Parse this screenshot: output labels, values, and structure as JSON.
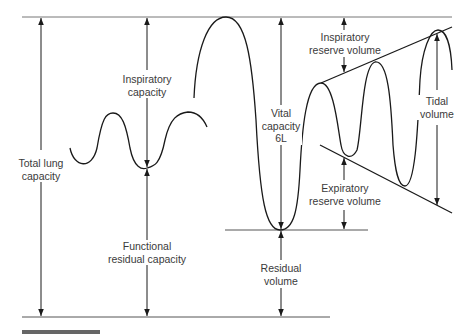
{
  "diagram": {
    "title": "",
    "labels": {
      "total_lung_capacity": [
        "Total lung",
        "capacity"
      ],
      "inspiratory_capacity": [
        "Inspiratory",
        "capacity"
      ],
      "functional_residual_capacity": [
        "Functional",
        "residual capacity"
      ],
      "vital_capacity": [
        "Vital",
        "capacity",
        "6L"
      ],
      "residual_volume": [
        "Residual",
        "volume"
      ],
      "inspiratory_reserve_volume": [
        "Inspiratory",
        "reserve volume"
      ],
      "expiratory_reserve_volume": [
        "Expiratory",
        "reserve volume"
      ],
      "tidal_volume": [
        "Tidal",
        "volume"
      ]
    },
    "colors": {
      "line": "#1a1a1a",
      "text": "#3a3a3a",
      "guide": "#555555"
    }
  }
}
